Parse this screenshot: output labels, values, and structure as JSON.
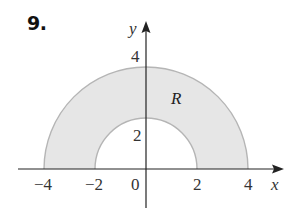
{
  "problem": {
    "number": "9."
  },
  "axes": {
    "x_label": "x",
    "y_label": "y",
    "x_ticks": [
      "−4",
      "−2",
      "0",
      "2",
      "4"
    ],
    "y_ticks": [
      "2",
      "4"
    ]
  },
  "region": {
    "label": "R",
    "inner_radius": 2,
    "outer_radius": 4,
    "fill_color": "#e6e6e6",
    "edge_color": "#b5b5b5"
  },
  "colors": {
    "axis": "#222222",
    "text": "#333333"
  }
}
